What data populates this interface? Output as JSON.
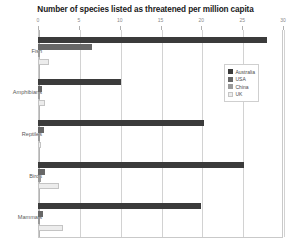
{
  "chart_data": {
    "type": "bar",
    "orientation": "horizontal",
    "title": "Number of species listed as threatened per million capita",
    "xlabel": "",
    "ylabel": "",
    "xlim": [
      0,
      30
    ],
    "xticks": [
      0,
      5,
      10,
      15,
      20,
      25,
      30
    ],
    "xtick_labels": [
      "0",
      "5",
      "10",
      "15",
      "20",
      "25",
      "30"
    ],
    "grid": true,
    "grid_axis": "x",
    "legend_position": "upper right",
    "categories": [
      "Fish",
      "Amphibians",
      "Reptiles",
      "Birds",
      "Mammals"
    ],
    "series": [
      {
        "name": "Australia",
        "color": "#3b3b3b",
        "values": [
          28.0,
          10.2,
          20.3,
          25.2,
          20.0
        ]
      },
      {
        "name": "USA",
        "color": "#676767",
        "values": [
          6.6,
          0.5,
          0.7,
          0.9,
          0.6
        ]
      },
      {
        "name": "China",
        "color": "#9a9a9a",
        "values": [
          0.3,
          0.2,
          0.3,
          0.4,
          0.3
        ]
      },
      {
        "name": "UK",
        "color": "#ececec",
        "values": [
          1.4,
          0.9,
          0.4,
          2.6,
          3.1
        ]
      }
    ]
  },
  "legend": {
    "items": [
      {
        "label": "Australia"
      },
      {
        "label": "USA"
      },
      {
        "label": "China"
      },
      {
        "label": "UK"
      }
    ]
  },
  "axis": {
    "tick_labels": [
      "0",
      "5",
      "10",
      "15",
      "20",
      "25",
      "30"
    ]
  },
  "categories": {
    "labels": [
      "Fish",
      "Amphibians",
      "Reptiles",
      "Birds",
      "Mammals"
    ]
  },
  "colors": {
    "australia": "#3b3b3b",
    "usa": "#676767",
    "china": "#9a9a9a",
    "uk": "#ececec",
    "grid": "#d2d2d2",
    "frame": "#c9c9c9"
  }
}
